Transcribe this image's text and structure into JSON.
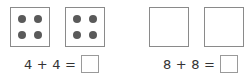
{
  "problems": [
    {
      "boxes": [
        {
          "dots": 4
        },
        {
          "dots": 4
        }
      ],
      "equation": "4 + 4 =",
      "answer": ""
    },
    {
      "boxes": [
        {
          "dots": 0
        },
        {
          "dots": 0
        }
      ],
      "equation": "8 + 8 =",
      "answer": ""
    }
  ],
  "colors": {
    "box_border": "#8a8a8a",
    "dot": "#5a5a5a",
    "text": "#333333",
    "answer_border": "#9a9a9a"
  }
}
